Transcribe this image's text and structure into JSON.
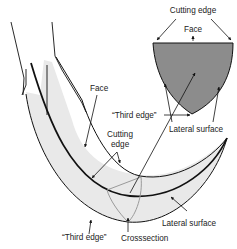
{
  "diagram": {
    "labels": {
      "cutting_edge_top": "Cutting edge",
      "face_top": "Face",
      "third_edge_top": "“Third edge”",
      "lateral_surface_top": "Lateral surface",
      "face_main": "Face",
      "cutting_edge_main_1": "Cutting",
      "cutting_edge_main_2": "edge",
      "lateral_surface_bottom": "Lateral surface",
      "third_edge_bottom": "“Third edge”",
      "crosssection": "Crosssection"
    },
    "colors": {
      "blade_fill": "#e9e9e9",
      "crosssection_fill": "#8c8c8c",
      "crosssection_outline": "#9a9a9a",
      "line": "#111111"
    }
  }
}
